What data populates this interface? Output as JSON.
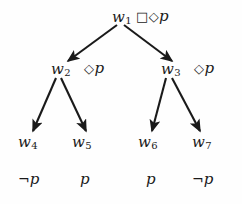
{
  "diagram": {
    "type": "tree",
    "background_color": "#fefefe",
    "stroke_color": "#1a1a1a",
    "nodes": [
      {
        "id": "w1",
        "label": "w",
        "subscript": "1",
        "x": 112,
        "y": 10,
        "annotation_operators": "□◇",
        "annotation_prop": "p",
        "annotation_x": 136,
        "annotation_y": 9,
        "level": 0
      },
      {
        "id": "w2",
        "label": "w",
        "subscript": "2",
        "x": 51,
        "y": 62,
        "annotation_operators": "◇",
        "annotation_prop": "p",
        "annotation_x": 84,
        "annotation_y": 61,
        "level": 1
      },
      {
        "id": "w3",
        "label": "w",
        "subscript": "3",
        "x": 161,
        "y": 62,
        "annotation_operators": "◇",
        "annotation_prop": "p",
        "annotation_x": 194,
        "annotation_y": 61,
        "level": 1
      },
      {
        "id": "w4",
        "label": "w",
        "subscript": "4",
        "x": 18,
        "y": 135,
        "annotation_operators": "",
        "annotation_prop": "",
        "level": 2
      },
      {
        "id": "w5",
        "label": "w",
        "subscript": "5",
        "x": 72,
        "y": 135,
        "annotation_operators": "",
        "annotation_prop": "",
        "level": 2
      },
      {
        "id": "w6",
        "label": "w",
        "subscript": "6",
        "x": 138,
        "y": 135,
        "annotation_operators": "",
        "annotation_prop": "",
        "level": 2
      },
      {
        "id": "w7",
        "label": "w",
        "subscript": "7",
        "x": 192,
        "y": 135,
        "annotation_operators": "",
        "annotation_prop": "",
        "level": 2
      }
    ],
    "edges": [
      {
        "id": "e1",
        "from": "w1",
        "to": "w2",
        "x1": 117,
        "y1": 25,
        "x2": 68,
        "y2": 61
      },
      {
        "id": "e2",
        "from": "w1",
        "to": "w3",
        "x1": 124,
        "y1": 25,
        "x2": 172,
        "y2": 61
      },
      {
        "id": "e3",
        "from": "w2",
        "to": "w4",
        "x1": 56,
        "y1": 78,
        "x2": 33,
        "y2": 131
      },
      {
        "id": "e4",
        "from": "w2",
        "to": "w5",
        "x1": 61,
        "y1": 78,
        "x2": 86,
        "y2": 131
      },
      {
        "id": "e5",
        "from": "w3",
        "to": "w6",
        "x1": 166,
        "y1": 78,
        "x2": 152,
        "y2": 131
      },
      {
        "id": "e6",
        "from": "w3",
        "to": "w7",
        "x1": 172,
        "y1": 78,
        "x2": 200,
        "y2": 131
      }
    ],
    "valuations": [
      {
        "id": "v4",
        "node": "w4",
        "negation": "¬",
        "prop": "p",
        "x": 18,
        "y": 172
      },
      {
        "id": "v5",
        "node": "w5",
        "negation": "",
        "prop": "p",
        "x": 80,
        "y": 172
      },
      {
        "id": "v6",
        "node": "w6",
        "negation": "",
        "prop": "p",
        "x": 146,
        "y": 172
      },
      {
        "id": "v7",
        "node": "w7",
        "negation": "¬",
        "prop": "p",
        "x": 192,
        "y": 172
      }
    ]
  }
}
